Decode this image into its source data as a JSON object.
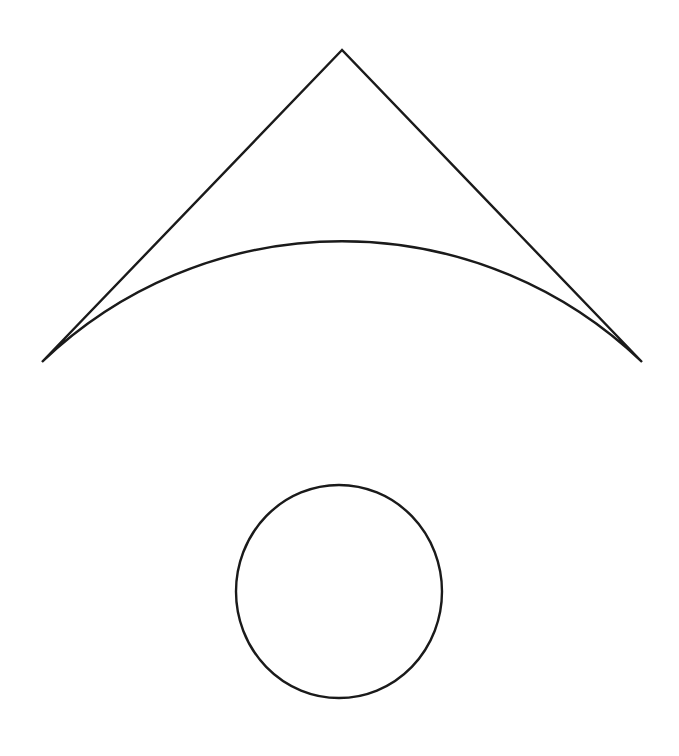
{
  "canvas": {
    "width": 679,
    "height": 756,
    "background_color": "#ffffff",
    "title": "Geometric line drawing: circular sector above a circle"
  },
  "style": {
    "stroke_color": "#1a1a1a",
    "stroke_width": 2.4,
    "fill": "none"
  },
  "shapes": [
    {
      "id": "sector",
      "name": "circular-sector",
      "description": "Circular sector (fan / wedge) with apex pointing up and a downward-bulging arc at the bottom",
      "apex": {
        "x": 342,
        "y": 50
      },
      "radius": 433,
      "left_corner": {
        "x": 42,
        "y": 362
      },
      "right_corner": {
        "x": 642,
        "y": 362
      },
      "arc_lowest_point": {
        "x": 342,
        "y": 486
      },
      "sweep_angle_degrees": 88,
      "arc_sweep_flag": 1,
      "large_arc_flag": 0,
      "path": "M 342 50 L 42 362 A 433 433 0 0 0 642 362 Z"
    },
    {
      "id": "circle",
      "name": "circle",
      "description": "Circle tangent to and slightly overlapping the bottom arc of the sector",
      "center": {
        "x": 339,
        "y": 591.5
      },
      "radius_x": 103,
      "radius_y": 106.5,
      "top": {
        "x": 339,
        "y": 485
      },
      "bottom": {
        "x": 339,
        "y": 698
      },
      "left": {
        "x": 236,
        "y": 591.5
      },
      "right": {
        "x": 442,
        "y": 591.5
      }
    }
  ],
  "chart_data": {
    "type": "scatter",
    "xlabel": "",
    "ylabel": "",
    "xlim": [
      0,
      679
    ],
    "ylim": [
      756,
      0
    ],
    "grid": false,
    "legend": "none",
    "annotations": [
      "Sector apex at (342, 50)",
      "Sector radius 433 px, arc spans 88 degrees",
      "Sector arc endpoints at (42, 362) and (642, 362)",
      "Arc lowest point at (342, 486)",
      "Circle center (339, 591.5), radii 103 x 106.5 px"
    ]
  }
}
